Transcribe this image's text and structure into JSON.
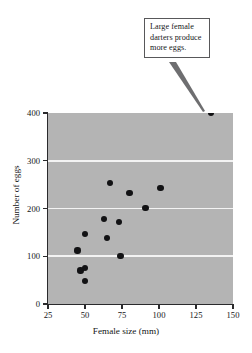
{
  "annotation": {
    "text": "Large female darters produce more eggs.",
    "lines": [
      "Large female",
      "darters produce",
      "more eggs."
    ],
    "points_to": {
      "x": 135,
      "y": 400
    }
  },
  "chart_data": {
    "type": "scatter",
    "title": "",
    "xlabel": "Female size (mm)",
    "ylabel": "Number of eggs",
    "xlim": [
      25,
      150
    ],
    "ylim": [
      0,
      400
    ],
    "xticks": [
      25,
      50,
      75,
      100,
      125,
      150
    ],
    "yticks": [
      0,
      100,
      200,
      300,
      400
    ],
    "xtick_labels": [
      "25",
      "50",
      "75",
      "100",
      "125",
      "150"
    ],
    "ytick_labels": [
      "0",
      "100",
      "200",
      "300",
      "400"
    ],
    "grid": "horizontal",
    "gridlines": [
      100,
      200,
      300
    ],
    "grid_color": "#f3f3f3",
    "plot_background": "#b4b4b4",
    "marker_color": "#121214",
    "legend": null,
    "series": [
      {
        "name": "darters",
        "points": [
          {
            "x": 45,
            "y": 112
          },
          {
            "x": 47,
            "y": 70
          },
          {
            "x": 50,
            "y": 75
          },
          {
            "x": 50,
            "y": 48
          },
          {
            "x": 50,
            "y": 146
          },
          {
            "x": 63,
            "y": 178
          },
          {
            "x": 65,
            "y": 138
          },
          {
            "x": 67,
            "y": 253
          },
          {
            "x": 73,
            "y": 172
          },
          {
            "x": 74,
            "y": 100
          },
          {
            "x": 80,
            "y": 232
          },
          {
            "x": 91,
            "y": 201
          },
          {
            "x": 101,
            "y": 243
          },
          {
            "x": 135,
            "y": 400
          }
        ]
      }
    ]
  }
}
